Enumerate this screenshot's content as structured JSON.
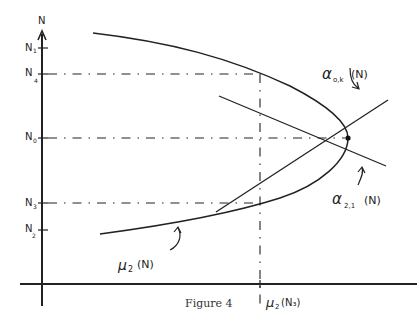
{
  "figure": {
    "caption": "Figure 4",
    "axes": {
      "y_label": "N",
      "x_tick_label": "μ₂(N₃)"
    },
    "y_ticks": [
      {
        "label": "N",
        "sub": "1"
      },
      {
        "label": "N",
        "sub": "4"
      },
      {
        "label": "N",
        "sub": "0"
      },
      {
        "label": "N",
        "sub": "3"
      },
      {
        "label": "N",
        "sub": "2"
      }
    ],
    "curves": {
      "mu": {
        "symbol": "μ",
        "sub": "2",
        "arg": "(N)"
      },
      "alpha_ok": {
        "symbol": "α",
        "sub": "o,k",
        "arg": "(N)"
      },
      "alpha_21": {
        "symbol": "α",
        "sub": "2,1",
        "arg": "(N)"
      }
    },
    "x_label": {
      "symbol": "μ",
      "sub": "2",
      "arg": "(N₃)"
    },
    "line_color": "#222222"
  }
}
